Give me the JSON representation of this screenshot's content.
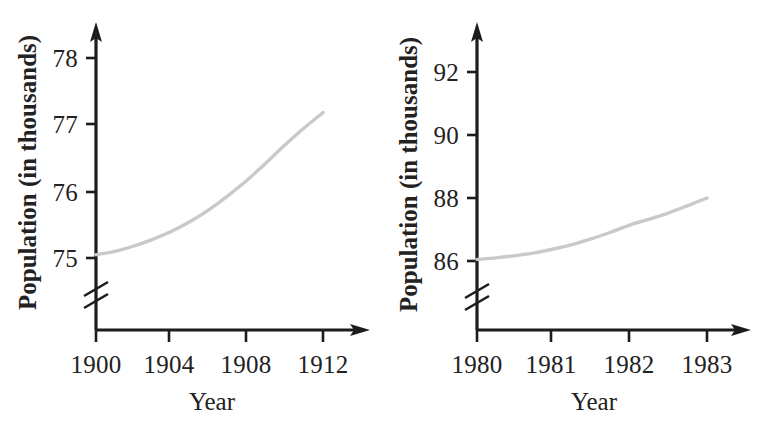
{
  "figure": {
    "background_color": "#ffffff",
    "axis_color": "#1c1c1c",
    "curve_color": "#c9c9c9",
    "panel_count": 2
  },
  "chart_data": [
    {
      "type": "line",
      "id": "left-chart",
      "title": "",
      "xlabel": "Year",
      "ylabel": "Population (in thousands)",
      "xlim": [
        1900,
        1913
      ],
      "ylim": [
        74.85,
        78.4
      ],
      "y_axis_break": true,
      "grid": false,
      "legend": "none",
      "xticks": [
        1900,
        1904,
        1908,
        1912
      ],
      "xtick_labels": [
        "1900",
        "1904",
        "1908",
        "1912"
      ],
      "yticks": [
        75,
        76,
        77,
        78
      ],
      "ytick_labels": [
        "75",
        "76",
        "77",
        "78"
      ],
      "series": [
        {
          "name": "Population",
          "x": [
            1900,
            1901,
            1902,
            1903,
            1904,
            1905,
            1906,
            1907,
            1908,
            1909,
            1910,
            1911,
            1912
          ],
          "values": [
            75.05,
            75.1,
            75.18,
            75.28,
            75.4,
            75.55,
            75.73,
            75.94,
            76.17,
            76.43,
            76.7,
            76.95,
            77.18
          ]
        }
      ]
    },
    {
      "type": "line",
      "id": "right-chart",
      "title": "",
      "xlabel": "Year",
      "ylabel": "Population (in thousands)",
      "xlim": [
        1980,
        1983.4
      ],
      "ylim": [
        85.65,
        93.0
      ],
      "y_axis_break": true,
      "grid": false,
      "legend": "none",
      "xticks": [
        1980,
        1981,
        1982,
        1983
      ],
      "xtick_labels": [
        "1980",
        "1981",
        "1982",
        "1983"
      ],
      "yticks": [
        86,
        88,
        90,
        92
      ],
      "ytick_labels": [
        "86",
        "88",
        "90",
        "92"
      ],
      "series": [
        {
          "name": "Population",
          "x": [
            1980,
            1980.25,
            1980.5,
            1980.75,
            1981,
            1981.25,
            1981.5,
            1981.75,
            1982,
            1982.25,
            1982.5,
            1982.75,
            1983
          ],
          "values": [
            86.05,
            86.1,
            86.17,
            86.26,
            86.38,
            86.53,
            86.71,
            86.92,
            87.15,
            87.33,
            87.53,
            87.76,
            88.0
          ]
        }
      ]
    }
  ],
  "left_panel": {
    "y_axis_title": "Population (in thousands)",
    "x_axis_title": "Year",
    "ytick_labels": [
      "78",
      "77",
      "76",
      "75"
    ],
    "xtick_labels": [
      "1900",
      "1904",
      "1908",
      "1912"
    ]
  },
  "right_panel": {
    "y_axis_title": "Population (in thousands)",
    "x_axis_title": "Year",
    "ytick_labels": [
      "92",
      "90",
      "88",
      "86"
    ],
    "xtick_labels": [
      "1980",
      "1981",
      "1982",
      "1983"
    ]
  }
}
